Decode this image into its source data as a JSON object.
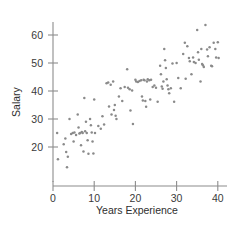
{
  "chart_data": {
    "type": "scatter",
    "title": "",
    "xlabel": "Years Experience",
    "ylabel": "Salary",
    "xlim": [
      0,
      41
    ],
    "ylim": [
      12,
      66
    ],
    "xticks": [
      0,
      10,
      20,
      30,
      40
    ],
    "yticks": [
      20,
      30,
      40,
      50,
      60
    ],
    "xtick_labels": [
      "0",
      "10",
      "20",
      "30",
      "40"
    ],
    "ytick_labels": [
      "20",
      "30",
      "40",
      "50",
      "60"
    ],
    "grid": false,
    "legend": false,
    "marker_color": "#8a8a8a",
    "axis_color": "#8c8c8c",
    "points": [
      [
        1.0,
        25.0
      ],
      [
        1.2,
        15.6
      ],
      [
        2.6,
        21.0
      ],
      [
        3.0,
        23.0
      ],
      [
        3.2,
        18.2
      ],
      [
        3.4,
        12.8
      ],
      [
        3.6,
        16.5
      ],
      [
        4.0,
        30.0
      ],
      [
        4.4,
        24.6
      ],
      [
        4.8,
        25.0
      ],
      [
        5.0,
        22.0
      ],
      [
        5.2,
        25.2
      ],
      [
        5.6,
        24.3
      ],
      [
        6.0,
        31.6
      ],
      [
        6.2,
        27.0
      ],
      [
        6.4,
        24.8
      ],
      [
        6.6,
        25.0
      ],
      [
        6.8,
        20.6
      ],
      [
        7.0,
        25.4
      ],
      [
        7.2,
        25.0
      ],
      [
        7.4,
        18.4
      ],
      [
        7.6,
        37.5
      ],
      [
        7.8,
        25.6
      ],
      [
        8.0,
        29.0
      ],
      [
        8.2,
        25.0
      ],
      [
        8.4,
        22.4
      ],
      [
        8.6,
        17.6
      ],
      [
        9.0,
        30.0
      ],
      [
        9.2,
        27.8
      ],
      [
        9.4,
        25.2
      ],
      [
        9.6,
        22.0
      ],
      [
        9.8,
        17.7
      ],
      [
        10.0,
        37.0
      ],
      [
        10.2,
        25.0
      ],
      [
        11.0,
        27.5
      ],
      [
        11.6,
        26.5
      ],
      [
        12.0,
        31.0
      ],
      [
        12.4,
        28.0
      ],
      [
        13.0,
        42.8
      ],
      [
        13.4,
        43.0
      ],
      [
        13.6,
        34.5
      ],
      [
        14.0,
        42.2
      ],
      [
        14.2,
        31.6
      ],
      [
        14.6,
        43.4
      ],
      [
        14.8,
        33.2
      ],
      [
        15.0,
        35.0
      ],
      [
        15.2,
        31.2
      ],
      [
        15.4,
        30.0
      ],
      [
        16.0,
        38.0
      ],
      [
        16.4,
        41.0
      ],
      [
        16.8,
        36.4
      ],
      [
        17.4,
        41.4
      ],
      [
        18.0,
        47.8
      ],
      [
        18.2,
        41.2
      ],
      [
        18.6,
        40.6
      ],
      [
        18.8,
        33.0
      ],
      [
        19.2,
        40.2
      ],
      [
        19.4,
        28.2
      ],
      [
        20.0,
        44.0
      ],
      [
        20.2,
        43.4
      ],
      [
        20.6,
        43.2
      ],
      [
        21.0,
        43.6
      ],
      [
        21.4,
        43.8
      ],
      [
        21.6,
        38.0
      ],
      [
        21.8,
        36.6
      ],
      [
        22.0,
        44.0
      ],
      [
        22.2,
        43.8
      ],
      [
        22.4,
        36.4
      ],
      [
        22.6,
        34.4
      ],
      [
        22.8,
        43.4
      ],
      [
        23.0,
        44.2
      ],
      [
        23.4,
        43.8
      ],
      [
        23.6,
        37.0
      ],
      [
        23.8,
        44.0
      ],
      [
        24.2,
        41.4
      ],
      [
        24.6,
        42.0
      ],
      [
        25.0,
        41.2
      ],
      [
        25.4,
        36.2
      ],
      [
        26.0,
        49.0
      ],
      [
        26.2,
        46.0
      ],
      [
        26.4,
        41.6
      ],
      [
        26.6,
        40.8
      ],
      [
        26.8,
        43.4
      ],
      [
        27.0,
        55.0
      ],
      [
        27.2,
        51.0
      ],
      [
        27.4,
        48.2
      ],
      [
        27.6,
        44.2
      ],
      [
        27.8,
        42.0
      ],
      [
        28.0,
        40.6
      ],
      [
        28.2,
        39.2
      ],
      [
        28.6,
        41.0
      ],
      [
        29.0,
        49.8
      ],
      [
        29.4,
        36.2
      ],
      [
        30.0,
        50.0
      ],
      [
        30.4,
        44.6
      ],
      [
        31.0,
        41.0
      ],
      [
        31.6,
        53.2
      ],
      [
        32.0,
        57.2
      ],
      [
        32.2,
        44.4
      ],
      [
        32.6,
        56.0
      ],
      [
        33.0,
        51.8
      ],
      [
        33.2,
        50.6
      ],
      [
        33.6,
        46.0
      ],
      [
        34.0,
        52.0
      ],
      [
        34.2,
        50.4
      ],
      [
        34.6,
        50.0
      ],
      [
        35.0,
        61.8
      ],
      [
        35.2,
        53.8
      ],
      [
        35.4,
        51.2
      ],
      [
        35.8,
        43.4
      ],
      [
        36.0,
        55.0
      ],
      [
        36.2,
        49.6
      ],
      [
        36.4,
        49.2
      ],
      [
        36.6,
        48.6
      ],
      [
        37.0,
        63.6
      ],
      [
        37.4,
        54.8
      ],
      [
        37.6,
        52.4
      ],
      [
        38.0,
        55.6
      ],
      [
        38.4,
        49.0
      ],
      [
        38.6,
        48.8
      ],
      [
        39.0,
        57.2
      ],
      [
        39.4,
        55.0
      ],
      [
        39.6,
        52.0
      ],
      [
        40.0,
        57.4
      ],
      [
        40.2,
        51.8
      ]
    ]
  }
}
